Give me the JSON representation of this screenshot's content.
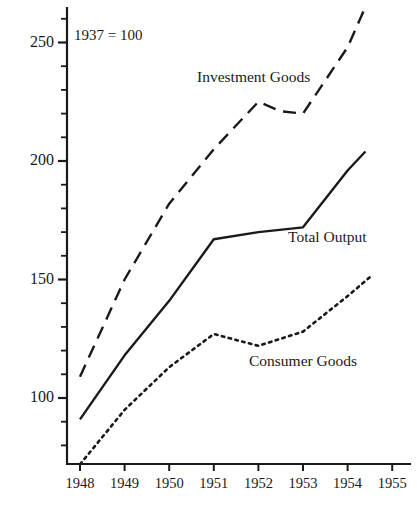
{
  "chart_data": {
    "type": "line",
    "title": "",
    "subtitle": "",
    "annotation_base": "1937 = 100",
    "xlabel": "",
    "ylabel": "",
    "x": [
      1948,
      1949,
      1950,
      1951,
      1952,
      1953,
      1954,
      1955
    ],
    "xtick_labels": [
      "1948",
      "1949",
      "1950",
      "1951",
      "1952",
      "1953",
      "1954",
      "1955"
    ],
    "ytick_labels": [
      "100",
      "150",
      "200",
      "250"
    ],
    "ytick_values": [
      100,
      150,
      200,
      250
    ],
    "yminor_step": 10,
    "xlim": [
      1948,
      1955.4
    ],
    "ylim": [
      72,
      268
    ],
    "grid": false,
    "legend_position": "inline-annotations",
    "series": [
      {
        "name": "Investment Goods",
        "label": "Investment Goods",
        "style": "dashed",
        "color": "#1a1a1a",
        "x": [
          1948,
          1949,
          1950,
          1951,
          1952,
          1952.5,
          1953,
          1954,
          1954.4
        ],
        "values": [
          109,
          150,
          182,
          205,
          225,
          221,
          220,
          248,
          265
        ]
      },
      {
        "name": "Total Output",
        "label": "Total Output",
        "style": "solid",
        "color": "#1a1a1a",
        "x": [
          1948,
          1949,
          1950,
          1951,
          1952,
          1953,
          1954,
          1954.4
        ],
        "values": [
          91,
          118,
          141,
          167,
          170,
          172,
          196,
          204
        ]
      },
      {
        "name": "Consumer Goods",
        "label": "Consumer Goods",
        "style": "dotted",
        "color": "#1a1a1a",
        "x": [
          1948,
          1949,
          1950,
          1951,
          1952,
          1953,
          1954,
          1954.5
        ],
        "values": [
          72,
          95,
          113,
          127,
          122,
          128,
          143,
          151
        ]
      }
    ]
  },
  "axes": {
    "axis_color": "#1a1a1a"
  }
}
